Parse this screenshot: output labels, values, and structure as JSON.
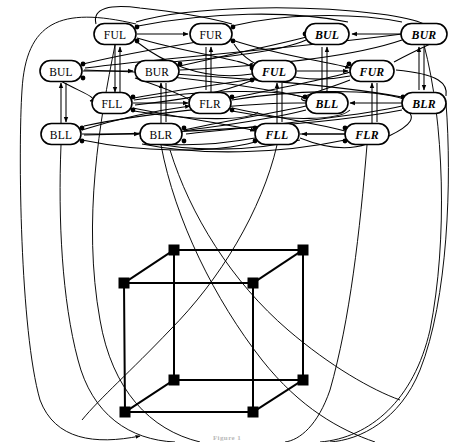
{
  "figure": {
    "caption": "Figure 1",
    "colors": {
      "ink": "#000000",
      "background": "#ffffff",
      "caption": "#b9b9b9"
    }
  },
  "graph": {
    "node_shape": "rounded-rectangle",
    "rows": [
      {
        "row": 1,
        "nodes": [
          {
            "id": "r1c1",
            "label": "FUL",
            "style": "upright",
            "x": 115,
            "y": 34,
            "w": 42,
            "h": 21
          },
          {
            "id": "r1c2",
            "label": "FUR",
            "style": "upright",
            "x": 211,
            "y": 34,
            "w": 42,
            "h": 21
          },
          {
            "id": "r1c3",
            "label": "BUL",
            "style": "italic",
            "x": 327,
            "y": 34,
            "w": 44,
            "h": 21
          },
          {
            "id": "r1c4",
            "label": "BUR",
            "style": "italic",
            "x": 424,
            "y": 34,
            "w": 46,
            "h": 21
          }
        ]
      },
      {
        "row": 2,
        "nodes": [
          {
            "id": "r2c1",
            "label": "BUL",
            "style": "upright",
            "x": 61,
            "y": 71,
            "w": 42,
            "h": 21
          },
          {
            "id": "r2c2",
            "label": "BUR",
            "style": "upright",
            "x": 157,
            "y": 71,
            "w": 44,
            "h": 21
          },
          {
            "id": "r2c3",
            "label": "FUL",
            "style": "italic",
            "x": 274,
            "y": 71,
            "w": 44,
            "h": 21
          },
          {
            "id": "r2c4",
            "label": "FUR",
            "style": "italic",
            "x": 372,
            "y": 71,
            "w": 44,
            "h": 21
          }
        ]
      },
      {
        "row": 3,
        "nodes": [
          {
            "id": "r3c1",
            "label": "FLL",
            "style": "upright",
            "x": 112,
            "y": 103,
            "w": 40,
            "h": 21
          },
          {
            "id": "r3c2",
            "label": "FLR",
            "style": "upright",
            "x": 210,
            "y": 103,
            "w": 42,
            "h": 21
          },
          {
            "id": "r3c3",
            "label": "BLL",
            "style": "italic",
            "x": 327,
            "y": 103,
            "w": 42,
            "h": 21
          },
          {
            "id": "r3c4",
            "label": "BLR",
            "style": "italic",
            "x": 424,
            "y": 103,
            "w": 44,
            "h": 21
          }
        ]
      },
      {
        "row": 4,
        "nodes": [
          {
            "id": "r4c1",
            "label": "BLL",
            "style": "upright",
            "x": 61,
            "y": 134,
            "w": 40,
            "h": 21
          },
          {
            "id": "r4c2",
            "label": "BLR",
            "style": "upright",
            "x": 161,
            "y": 134,
            "w": 42,
            "h": 21
          },
          {
            "id": "r4c3",
            "label": "FLL",
            "style": "italic",
            "x": 277,
            "y": 134,
            "w": 44,
            "h": 21
          },
          {
            "id": "r4c4",
            "label": "FLR",
            "style": "italic",
            "x": 367,
            "y": 134,
            "w": 44,
            "h": 21
          }
        ]
      }
    ]
  },
  "cube": {
    "label": "3-cube",
    "vertices": [
      {
        "id": "btl",
        "name": "back-top-left",
        "x": 174,
        "y": 250
      },
      {
        "id": "btr",
        "name": "back-top-right",
        "x": 303,
        "y": 250
      },
      {
        "id": "ftl",
        "name": "front-top-left",
        "x": 124,
        "y": 283
      },
      {
        "id": "ftr",
        "name": "front-top-right",
        "x": 253,
        "y": 283
      },
      {
        "id": "bbl",
        "name": "back-bottom-left",
        "x": 174,
        "y": 380
      },
      {
        "id": "bbr",
        "name": "back-bottom-right",
        "x": 303,
        "y": 380
      },
      {
        "id": "fbl",
        "name": "front-bottom-left",
        "x": 125,
        "y": 412
      },
      {
        "id": "fbr",
        "name": "front-bottom-right",
        "x": 253,
        "y": 412
      }
    ],
    "edges": [
      [
        "btl",
        "btr"
      ],
      [
        "btl",
        "ftl"
      ],
      [
        "btl",
        "bbl"
      ],
      [
        "btr",
        "ftr"
      ],
      [
        "btr",
        "bbr"
      ],
      [
        "ftl",
        "ftr"
      ],
      [
        "ftl",
        "fbl"
      ],
      [
        "ftr",
        "fbr"
      ],
      [
        "bbl",
        "bbr"
      ],
      [
        "bbl",
        "fbl"
      ],
      [
        "bbr",
        "fbr"
      ],
      [
        "fbl",
        "fbr"
      ]
    ]
  }
}
